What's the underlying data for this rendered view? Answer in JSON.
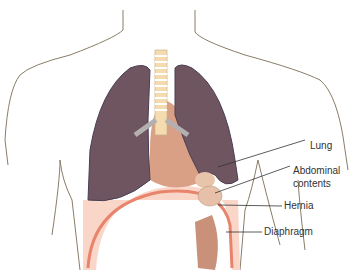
{
  "figure": {
    "labels": {
      "lung": "Lung",
      "abdominal_contents_1": "Abdominal",
      "abdominal_contents_2": "contents",
      "hernia": "Hernia",
      "diaphragm": "Diaphragm"
    },
    "colors": {
      "lung": "#6e5560",
      "lung_outline": "#4a3e55",
      "diaphragm": "#f2b3a0",
      "diaphragm_edge": "#e8836c",
      "abdomen_bg": "#f9d6c8",
      "trachea": "#f4dcb0",
      "body_outline": "#8a7d68"
    }
  }
}
